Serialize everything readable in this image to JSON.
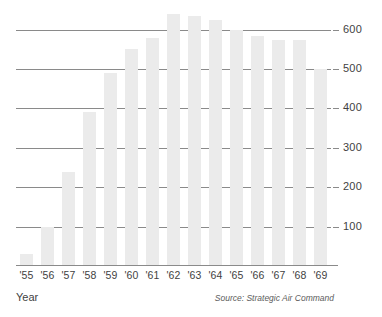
{
  "chart_data": {
    "type": "bar",
    "title": "",
    "subtitle": "",
    "xlabel": "Year",
    "ylabel": "",
    "categories": [
      "'55",
      "'56",
      "'57",
      "'58",
      "'59",
      "'60",
      "'61",
      "'62",
      "'63",
      "'64",
      "'65",
      "'66",
      "'67",
      "'68",
      "'69"
    ],
    "values": [
      30,
      100,
      240,
      390,
      490,
      550,
      580,
      640,
      635,
      625,
      600,
      585,
      575,
      573,
      500
    ],
    "series": [
      {
        "name": "",
        "values": [
          30,
          100,
          240,
          390,
          490,
          550,
          580,
          640,
          635,
          625,
          600,
          585,
          575,
          573,
          500
        ]
      }
    ],
    "ylim": [
      0,
      660
    ],
    "yticks": [
      100,
      200,
      300,
      400,
      500,
      600
    ],
    "ytick_labels": [
      "100",
      "200",
      "300",
      "400",
      "500",
      "600"
    ],
    "grid": true,
    "gridlines_at": [
      100,
      200,
      300,
      400,
      500,
      600
    ],
    "legend": "none",
    "annotations": [
      "Source: Strategic Air Command"
    ],
    "bar_color": "#ebebeb",
    "grid_color": "#8a8a8a",
    "text_color": "#3f3f3f",
    "background_color": "#ffffff"
  },
  "axis": {
    "x_title": "Year",
    "y_tick_labels": [
      "600",
      "500",
      "400",
      "300",
      "200",
      "100"
    ]
  },
  "footer": {
    "source": "Source: Strategic Air Command"
  }
}
